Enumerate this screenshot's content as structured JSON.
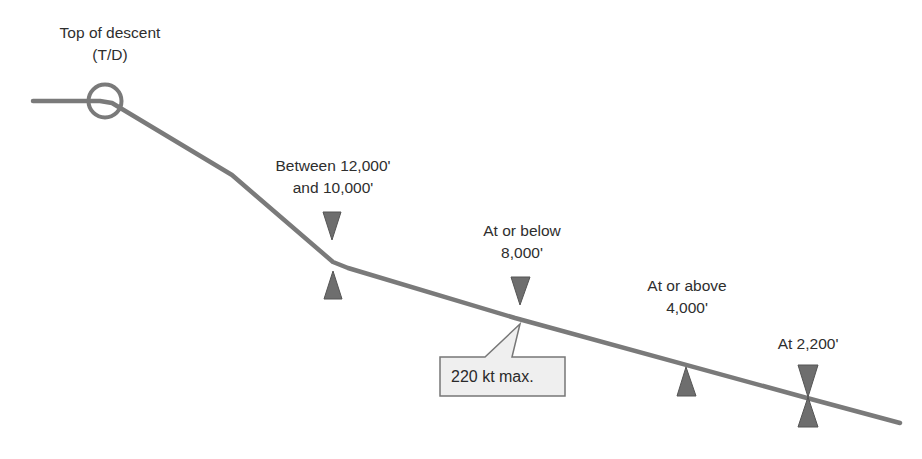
{
  "diagram": {
    "colors": {
      "path": "#7a7a7a",
      "marker": "#6e6e6e",
      "marker_stroke": "#555555",
      "callout_fill": "#efefef",
      "callout_stroke": "#777777",
      "text": "#2e2e2e"
    },
    "top_of_descent": {
      "line1": "Top of descent",
      "line2": "(T/D)"
    },
    "constraints": [
      {
        "id": "window",
        "line1": "Between 12,000'",
        "line2": "and 10,000'",
        "markers": [
          "at-or-below",
          "at-or-above"
        ]
      },
      {
        "id": "below-8000",
        "line1": "At or below",
        "line2": "8,000'",
        "markers": [
          "at-or-below"
        ]
      },
      {
        "id": "above-4000",
        "line1": "At or above",
        "line2": "4,000'",
        "markers": [
          "at-or-above"
        ]
      },
      {
        "id": "at-2200",
        "line1": "At 2,200'",
        "markers": [
          "at-or-below",
          "at-or-above"
        ]
      }
    ],
    "speed_callout": {
      "text": "220 kt max."
    }
  }
}
